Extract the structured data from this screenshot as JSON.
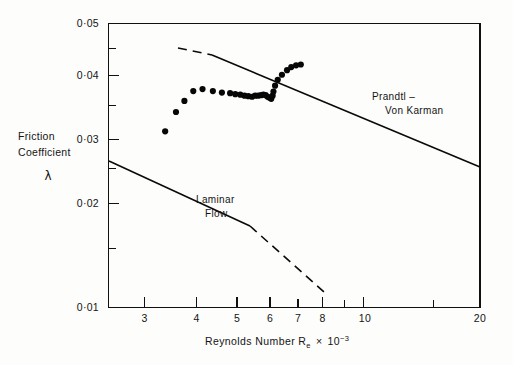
{
  "figure": {
    "background_color": "#fdfdfc",
    "ink_color": "#0a0a0a"
  },
  "axes": {
    "x_title_main": "Reynolds  Number  R",
    "x_title_sub": "e",
    "x_title_times": "×",
    "x_title_base": "10",
    "x_title_exp": "−3",
    "y_title_line1": "Friction",
    "y_title_line2": "Coefficient",
    "y_title_symbol": "λ"
  },
  "labels": {
    "prandtl_line1": "Prandtl –",
    "prandtl_line2": "Von  Karman",
    "laminar_line1": "Laminar",
    "laminar_line2": "Flow"
  },
  "chart_data": {
    "type": "scatter",
    "title": "",
    "xlabel": "Reynolds Number Re × 10⁻³",
    "ylabel": "Friction Coefficient λ",
    "xscale": "log",
    "yscale": "log",
    "xlim": [
      2.45,
      21.0
    ],
    "ylim": [
      0.0097,
      0.0505
    ],
    "grid": false,
    "legend": "none",
    "x_ticks_major": [
      3,
      4,
      5,
      6,
      7,
      8,
      10,
      20
    ],
    "x_tick_labels": [
      "3",
      "4",
      "5",
      "6",
      "7",
      "8",
      "10",
      "20"
    ],
    "x_ticks_minor": [
      9,
      15
    ],
    "y_ticks_major": [
      0.01,
      0.02,
      0.03,
      0.04,
      0.05
    ],
    "y_tick_labels": [
      "0·01",
      "0·02",
      "0·03",
      "0·04",
      "0·05"
    ],
    "y_ticks_minor": [
      0.015,
      0.025,
      0.035,
      0.045
    ],
    "series": [
      {
        "name": "Measured friction coefficient",
        "type": "scatter",
        "marker": "filled-circle",
        "points": [
          [
            3.4,
            0.027
          ],
          [
            3.62,
            0.0302
          ],
          [
            3.8,
            0.0322
          ],
          [
            4.0,
            0.0341
          ],
          [
            4.22,
            0.0345
          ],
          [
            4.48,
            0.0341
          ],
          [
            4.72,
            0.0338
          ],
          [
            4.95,
            0.0337
          ],
          [
            5.1,
            0.0335
          ],
          [
            5.25,
            0.0334
          ],
          [
            5.38,
            0.0332
          ],
          [
            5.5,
            0.0331
          ],
          [
            5.62,
            0.033
          ],
          [
            5.72,
            0.0332
          ],
          [
            5.82,
            0.0332
          ],
          [
            5.92,
            0.0333
          ],
          [
            6.0,
            0.0334
          ],
          [
            6.08,
            0.0333
          ],
          [
            6.15,
            0.033
          ],
          [
            6.22,
            0.0328
          ],
          [
            6.28,
            0.0326
          ],
          [
            6.33,
            0.0332
          ],
          [
            6.36,
            0.034
          ],
          [
            6.42,
            0.0352
          ],
          [
            6.52,
            0.0364
          ],
          [
            6.68,
            0.0375
          ],
          [
            6.88,
            0.0385
          ],
          [
            7.05,
            0.0392
          ],
          [
            7.25,
            0.0396
          ],
          [
            7.45,
            0.0398
          ]
        ]
      },
      {
        "name": "Prandtl – Von Karman",
        "type": "line",
        "style": "dashed-then-solid",
        "dashed_segment": [
          [
            3.72,
            0.0437
          ],
          [
            4.35,
            0.042
          ]
        ],
        "solid_segment": [
          [
            4.35,
            0.042
          ],
          [
            20.0,
            0.0251
          ]
        ]
      },
      {
        "name": "Laminar Flow",
        "type": "line",
        "style": "solid-then-dashed",
        "solid_segment": [
          [
            2.5,
            0.0261
          ],
          [
            5.35,
            0.0183
          ]
        ],
        "dashed_segment": [
          [
            5.35,
            0.0183
          ],
          [
            8.1,
            0.0128
          ]
        ]
      }
    ],
    "annotations": [
      {
        "text": "Prandtl – Von Karman",
        "x": 9.2,
        "y": 0.0345
      },
      {
        "text": "Laminar Flow",
        "x": 4.5,
        "y": 0.0222
      }
    ]
  }
}
